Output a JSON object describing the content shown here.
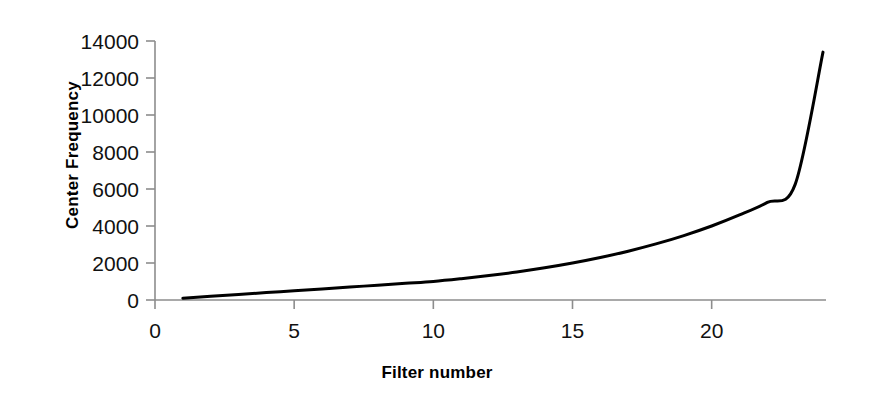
{
  "chart_data": {
    "type": "line",
    "title": "",
    "xlabel": "Filter number",
    "ylabel": "Center Frequency",
    "xlim": [
      0,
      24
    ],
    "ylim": [
      0,
      14000
    ],
    "grid": false,
    "legend": null,
    "x_ticks": [
      "0",
      "5",
      "10",
      "15",
      "20"
    ],
    "x_tick_values": [
      0,
      5,
      10,
      15,
      20
    ],
    "y_ticks": [
      "0",
      "2000",
      "4000",
      "6000",
      "8000",
      "10000",
      "12000",
      "14000"
    ],
    "y_tick_values": [
      0,
      2000,
      4000,
      6000,
      8000,
      10000,
      12000,
      14000
    ],
    "series": [
      {
        "name": "Center Frequency",
        "color": "#000000",
        "x": [
          1,
          2,
          3,
          4,
          5,
          6,
          7,
          8,
          9,
          10,
          11,
          12,
          13,
          14,
          15,
          16,
          17,
          18,
          19,
          20,
          21,
          22,
          23,
          24
        ],
        "values": [
          100,
          200,
          300,
          400,
          500,
          600,
          700,
          800,
          900,
          1000,
          1149,
          1320,
          1516,
          1741,
          2000,
          2297,
          2639,
          3031,
          3482,
          4000,
          4595,
          5280,
          6250,
          13400
        ]
      }
    ]
  },
  "axes": {
    "y_axis_title": "Center Frequency",
    "x_axis_title": "Filter number"
  },
  "curve": {
    "stroke_color": "#000000",
    "stroke_width": "3",
    "axis_color": "#888888",
    "start_label": "filter 1",
    "end_label": "filter 24"
  }
}
